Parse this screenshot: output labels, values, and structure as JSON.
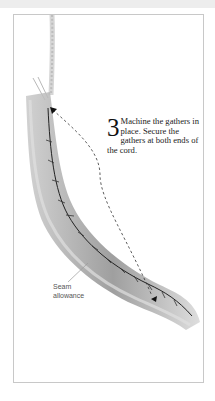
{
  "instruction": {
    "step_number": "3",
    "text": "Machine the gathers in place. Secure the gathers at both ends of the cord."
  },
  "annotation": {
    "label_line1": "Seam",
    "label_line2": "allowance"
  },
  "colors": {
    "frame_border": "#c8c8c8",
    "top_band": "#ededed",
    "fabric": "#9a9a9a",
    "stitch": "#222222"
  }
}
